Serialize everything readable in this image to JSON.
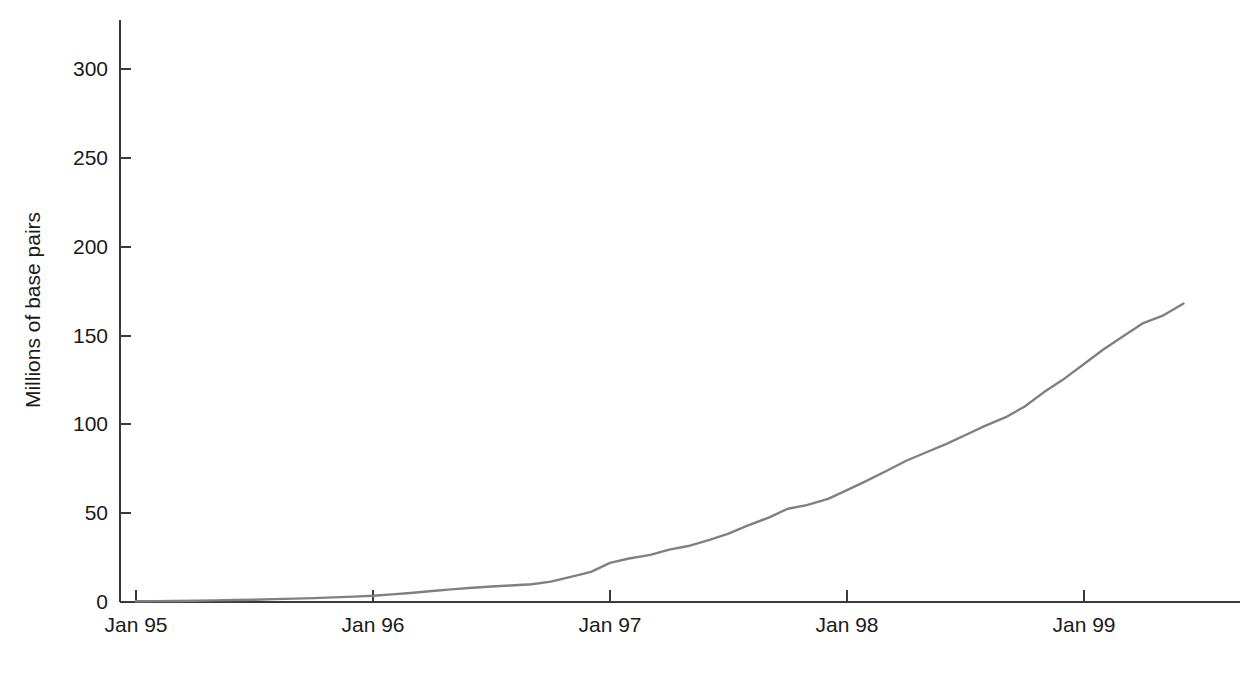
{
  "chart_data": {
    "type": "line",
    "title": "",
    "subtitle": "",
    "xlabel": "",
    "ylabel": "Millions of base pairs",
    "xlim": [
      "Jan 95",
      "mid 1999"
    ],
    "ylim": [
      0,
      320
    ],
    "grid": false,
    "legend": null,
    "y_ticks": [
      {
        "value": 0,
        "label": "0"
      },
      {
        "value": 50,
        "label": "50"
      },
      {
        "value": 100,
        "label": "100"
      },
      {
        "value": 150,
        "label": "150"
      },
      {
        "value": 200,
        "label": "200"
      },
      {
        "value": 250,
        "label": "250"
      },
      {
        "value": 300,
        "label": "300"
      }
    ],
    "x_ticks": [
      {
        "value": 0,
        "label": "Jan 95"
      },
      {
        "value": 1,
        "label": "Jan 96"
      },
      {
        "value": 2,
        "label": "Jan 97"
      },
      {
        "value": 3,
        "label": "Jan 98"
      },
      {
        "value": 4,
        "label": "Jan 99"
      }
    ],
    "series": [
      {
        "name": "GenBank cumulative base pairs",
        "color": "#808080",
        "x": [
          0.0,
          0.08,
          0.17,
          0.25,
          0.33,
          0.42,
          0.5,
          0.58,
          0.67,
          0.75,
          0.83,
          0.92,
          1.0,
          1.08,
          1.17,
          1.25,
          1.33,
          1.42,
          1.5,
          1.58,
          1.67,
          1.75,
          1.83,
          1.92,
          2.0,
          2.08,
          2.17,
          2.25,
          2.33,
          2.42,
          2.5,
          2.58,
          2.67,
          2.75,
          2.83,
          2.92,
          3.0,
          3.08,
          3.17,
          3.25,
          3.33,
          3.42,
          3.5,
          3.58,
          3.67,
          3.75,
          3.83,
          3.92,
          4.0,
          4.08,
          4.17,
          4.25,
          4.33,
          4.42
        ],
        "y": [
          0.4,
          0.5,
          0.6,
          0.7,
          0.9,
          1.1,
          1.3,
          1.6,
          1.9,
          2.2,
          2.6,
          3.0,
          3.5,
          4.3,
          5.2,
          6.2,
          7.1,
          8.0,
          8.7,
          9.3,
          10.0,
          11.5,
          14.0,
          17.0,
          22.0,
          24.5,
          26.5,
          29.5,
          31.5,
          35.0,
          38.5,
          43.0,
          47.5,
          52.5,
          54.5,
          58.0,
          63.0,
          68.0,
          74.0,
          79.5,
          84.0,
          89.0,
          94.0,
          99.0,
          104.0,
          110.0,
          118.0,
          126.0,
          134.0,
          142.0,
          150.0,
          157.0,
          161.0,
          168.0
        ]
      }
    ],
    "annotations": []
  },
  "axis": {
    "y_title": "Millions of base pairs"
  },
  "labels": {
    "y0": "0",
    "y50": "50",
    "y100": "100",
    "y150": "150",
    "y200": "200",
    "y250": "250",
    "y300": "300",
    "x0": "Jan 95",
    "x1": "Jan 96",
    "x2": "Jan 97",
    "x3": "Jan 98",
    "x4": "Jan 99"
  },
  "colors": {
    "line": "#808080",
    "axis": "#3a3a3a",
    "text": "#1a1a1a",
    "background": "#ffffff"
  }
}
